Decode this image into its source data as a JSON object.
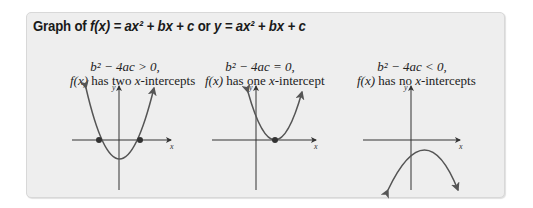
{
  "title": {
    "prefix": "Graph of ",
    "f": "f(x)",
    "eq1": " = ax² + bx + c",
    "or": " or ",
    "y": "y",
    "eq2": " = ax² + bx + c"
  },
  "panels": [
    {
      "condition": "b² − 4ac > 0,",
      "description": "f(x) has two x-intercepts",
      "desc_parts": {
        "fx": "f(x)",
        "mid": " has two ",
        "x": "x",
        "end": "-intercepts"
      },
      "x_label": "x",
      "y_label": "y",
      "opens": "up",
      "intercepts": 2
    },
    {
      "condition": "b² − 4ac = 0,",
      "description": "f(x) has one x-intercept",
      "desc_parts": {
        "fx": "f(x)",
        "mid": " has one ",
        "x": "x",
        "end": "-intercept"
      },
      "x_label": "x",
      "y_label": "y",
      "opens": "up",
      "intercepts": 1
    },
    {
      "condition": "b² − 4ac < 0,",
      "description": "f(x) has no x-intercepts",
      "desc_parts": {
        "fx": "f(x)",
        "mid": " has no ",
        "x": "x",
        "end": "-intercepts"
      },
      "x_label": "x",
      "y_label": "y",
      "opens": "down",
      "intercepts": 0
    }
  ],
  "colors": {
    "box_bg": "#eeeeee",
    "curve": "#555555",
    "axis": "#333333",
    "point": "#333333"
  }
}
